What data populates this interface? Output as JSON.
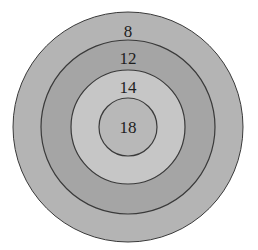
{
  "diagram": {
    "type": "concentric-target",
    "center": [
      128,
      127
    ],
    "rings": [
      {
        "label": "8",
        "radius": 115,
        "fill": "#b4b4b4",
        "label_y": 33
      },
      {
        "label": "12",
        "radius": 87,
        "fill": "#a5a5a5",
        "label_y": 63
      },
      {
        "label": "14",
        "radius": 57,
        "fill": "#c6c6c6",
        "label_y": 92
      },
      {
        "label": "18",
        "radius": 29,
        "fill": "#b8b8b8",
        "label_y": 133
      }
    ],
    "stroke": "#3a3a3a"
  }
}
